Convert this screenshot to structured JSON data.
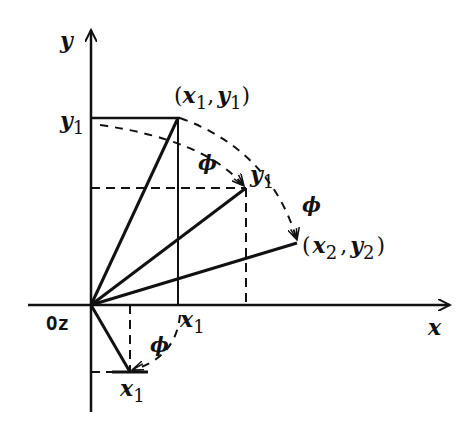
{
  "diagram": {
    "title": "",
    "axes": {
      "x_label": "x",
      "y_label": "y",
      "origin_label": "Oz"
    },
    "points": {
      "p1": {
        "label_open": "(",
        "var1": "x",
        "sub1": "1",
        "comma": ",",
        "var2": "y",
        "sub2": "1",
        "label_close": ")"
      },
      "p2": {
        "label_open": "(",
        "var1": "x",
        "sub1": "2",
        "comma": ",",
        "var2": "y",
        "sub2": "2",
        "label_close": ")"
      },
      "v1": {
        "var": "y",
        "sub": "1"
      }
    },
    "tick_labels": {
      "y1": {
        "var": "y",
        "sub": "1"
      },
      "x1_axis": {
        "var": "x",
        "sub": "1"
      },
      "x1_below": {
        "var": "x",
        "sub": "1"
      }
    },
    "angle_label": "ϕ",
    "colors": {
      "stroke": "#111111",
      "background": "#ffffff"
    }
  }
}
